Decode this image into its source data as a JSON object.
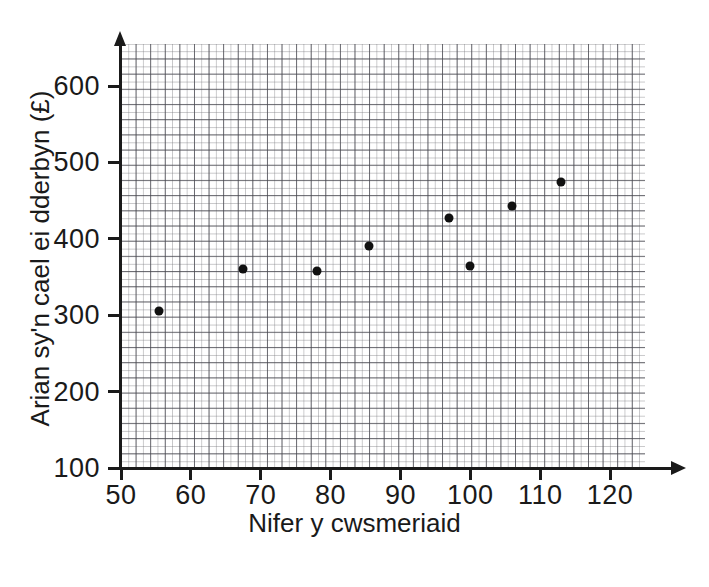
{
  "chart_data": {
    "type": "scatter",
    "title": "",
    "xlabel": "Nifer y cwsmeriaid",
    "ylabel": "Arian sy'n cael ei dderbyn (£)",
    "xlim": [
      50,
      125
    ],
    "ylim": [
      100,
      655
    ],
    "xticks": [
      50,
      60,
      70,
      80,
      90,
      100,
      110,
      120
    ],
    "yticks": [
      100,
      200,
      300,
      400,
      500,
      600
    ],
    "xtick_labels": [
      "50",
      "60",
      "70",
      "80",
      "90",
      "100",
      "110",
      "120"
    ],
    "ytick_labels": [
      "100",
      "200",
      "300",
      "400",
      "500",
      "600"
    ],
    "grid": true,
    "grid_minor_step_x": 1,
    "grid_minor_step_y": 10,
    "grid_major_step_x": 2,
    "grid_major_step_y": 20,
    "legend": null,
    "marker_color": "#111111",
    "points": [
      {
        "x": 55.5,
        "y": 305
      },
      {
        "x": 67.5,
        "y": 360
      },
      {
        "x": 78,
        "y": 358
      },
      {
        "x": 85.5,
        "y": 390
      },
      {
        "x": 97,
        "y": 427
      },
      {
        "x": 100,
        "y": 365
      },
      {
        "x": 106,
        "y": 443
      },
      {
        "x": 113,
        "y": 474
      }
    ],
    "x": [
      55.5,
      67.5,
      78,
      85.5,
      97,
      100,
      106,
      113
    ],
    "values": [
      305,
      360,
      358,
      390,
      427,
      365,
      443,
      474
    ]
  }
}
